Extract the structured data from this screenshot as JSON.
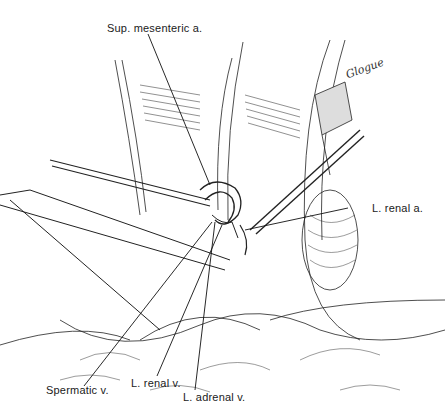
{
  "figure": {
    "type": "surgical line illustration",
    "signature": "Glogue"
  },
  "labels": {
    "sup_mesenteric": "Sup. mesenteric  a.",
    "renal_a": "L. renal a.",
    "spermatic_v": "Spermatic v.",
    "renal_v": "L. renal v.",
    "adrenal_v": "L. adrenal v."
  },
  "colors": {
    "ink": "#1a1a1a",
    "background": "#ffffff"
  }
}
